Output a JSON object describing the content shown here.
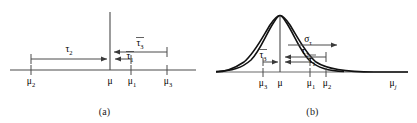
{
  "figure": {
    "background_color": "#ffffff",
    "line_color": "#3a3a3a",
    "curve_color": "#1a1a1a",
    "text_color": "#1a1a1a"
  },
  "panels": [
    {
      "id": "a",
      "caption": "(a)",
      "type": "number-line",
      "axis_ticks": [
        {
          "name": "mu-2",
          "label": "μ",
          "sub": "2",
          "x": 31
        },
        {
          "name": "mu",
          "label": "μ",
          "sub": "",
          "x": 110
        },
        {
          "name": "mu-1",
          "label": "μ",
          "sub": "1",
          "x": 131
        },
        {
          "name": "mu-3",
          "label": "μ",
          "sub": "3",
          "x": 167
        }
      ],
      "arrows": [
        {
          "name": "tau-2",
          "label": "τ",
          "sub": "2",
          "overbar": false,
          "from_x": 31,
          "to_x": 107,
          "y": 59,
          "label_x": 69,
          "label_y": 50
        },
        {
          "name": "tau-3",
          "label": "τ",
          "sub": "3",
          "overbar": true,
          "from_x": 167,
          "to_x": 112,
          "y": 52,
          "label_x": 141,
          "label_y": 43
        },
        {
          "name": "tau-1",
          "label": "τ",
          "sub": "1",
          "overbar": true,
          "from_x": 131,
          "to_x": 114,
          "y": 59,
          "label_x": 130,
          "label_y": 57
        }
      ],
      "vertical_line": {
        "name": "mu-vertical-line",
        "x": 110,
        "y_top": 12,
        "y_bottom": 70
      }
    },
    {
      "id": "b",
      "caption": "(b)",
      "type": "gaussian-curve",
      "axis_label": {
        "name": "mu-j-axis-label",
        "label": "μ",
        "sub": "j",
        "x": 185,
        "y": 84
      },
      "axis_ticks": [
        {
          "name": "mu-3",
          "label": "μ",
          "sub": "3",
          "x": 55
        },
        {
          "name": "mu",
          "label": "μ",
          "sub": "",
          "x": 72
        },
        {
          "name": "mu-1",
          "label": "μ",
          "sub": "1",
          "x": 102
        },
        {
          "name": "mu-2",
          "label": "μ",
          "sub": "2",
          "x": 118
        }
      ],
      "arrows": [
        {
          "name": "sigma-tau",
          "label": "σ",
          "sub": "τ",
          "overbar": false,
          "from_x": 80,
          "to_x": 129,
          "y": 45,
          "label_x": 100,
          "label_y": 38
        },
        {
          "name": "tau-2",
          "label": "τ",
          "sub": "2",
          "overbar": false,
          "from_x": 118,
          "to_x": 75,
          "y": 57,
          "label_x": 97,
          "label_y": 50
        },
        {
          "name": "tau-3",
          "label": "τ",
          "sub": "3",
          "overbar": true,
          "from_x": 55,
          "to_x": 70,
          "y": 62,
          "label_x": 55,
          "label_y": 55
        },
        {
          "name": "tau-1",
          "label": "τ",
          "sub": "1",
          "overbar": true,
          "from_x": 102,
          "to_x": 75,
          "y": 62,
          "label_x": 104,
          "label_y": 60
        }
      ],
      "curve": {
        "name": "gaussian-curve",
        "peak_x": 72,
        "peak_y": 15,
        "baseline_y": 72,
        "sigma": 34
      },
      "vertical_line": {
        "name": "mu-vertical-line",
        "x": 72,
        "y_top": 14,
        "y_bottom": 72
      }
    }
  ]
}
